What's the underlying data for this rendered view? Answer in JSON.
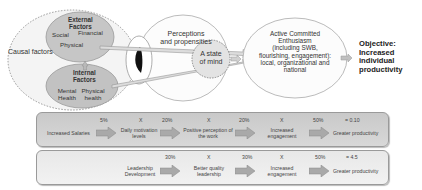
{
  "upper": {
    "causal_factors": "Causal factors",
    "external_factors": {
      "title_line1": "External",
      "title_line2": "Factors",
      "items": [
        "Social",
        "Financial",
        "Physical"
      ]
    },
    "internal_factors": {
      "title_line1": "Internal",
      "title_line2": "Factors",
      "items": [
        "Mental Health",
        "Physical health"
      ]
    },
    "perceptions_line1": "Perceptions",
    "perceptions_line2": "and propensities",
    "state_of_mind_line1": "A state",
    "state_of_mind_line2": "of mind",
    "ace_lines": [
      "Active Committed",
      "Enthusiasm",
      "(including SWB,",
      "flourishing, engagement):",
      "local, organizational and",
      "national"
    ],
    "objective_lines": [
      "Objective:",
      "Increased",
      "individual",
      "productivity"
    ]
  },
  "chains": [
    {
      "steps": [
        "Increased Salaries",
        "Daily motivation levels",
        "Positive perception of the work",
        "Increased engagement",
        "Greater productivity"
      ],
      "percentages": [
        "5%",
        "20%",
        "20%",
        "50%"
      ],
      "multipliers": [
        "X",
        "X",
        "X"
      ],
      "result": "= 0.10"
    },
    {
      "steps": [
        "Leadership Development",
        "Better quality leadership",
        "Increased engagement",
        "Greater productivity"
      ],
      "percentages": [
        "30%",
        "30%",
        "50%"
      ],
      "multipliers": [
        "X",
        "X"
      ],
      "result": "= 4.5"
    }
  ],
  "colors": {
    "ellipse_fill": "#c8c8c8",
    "row1_fill": "#cfcfcf",
    "row2_fill": "#ededed",
    "arrow_fill": "#a9a9a9",
    "line": "#888888"
  }
}
